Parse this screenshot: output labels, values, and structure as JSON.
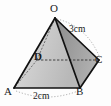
{
  "figure": {
    "type": "square-pyramid-diagram",
    "background_color": "#fdfdfd",
    "edge_color": "#1a1a1a",
    "hidden_edge_style": "dashed",
    "face_colors": {
      "left_face_OAD": "#e9e9e9",
      "front_face_OAB": "#cfcfcf",
      "right_face_OBC": "#9a9a9a",
      "base_ABCD": "#c3c3c3"
    },
    "vertices": [
      {
        "name": "O",
        "label": "O",
        "role": "apex",
        "x": 55,
        "y": 18
      },
      {
        "name": "A",
        "label": "A",
        "role": "base-front-left",
        "x": 14,
        "y": 88
      },
      {
        "name": "B",
        "label": "B",
        "role": "base-front-right",
        "x": 80,
        "y": 88
      },
      {
        "name": "C",
        "label": "C",
        "role": "base-right",
        "x": 99,
        "y": 60
      },
      {
        "name": "D",
        "label": "D",
        "role": "base-hidden-back",
        "x": 37,
        "y": 60
      }
    ],
    "measurements": [
      {
        "name": "edge-OC",
        "label": "3cm",
        "value": 3,
        "unit": "cm",
        "edge": "OC"
      },
      {
        "name": "edge-AB",
        "label": "2cm",
        "value": 2,
        "unit": "cm",
        "edge": "AB"
      }
    ],
    "edges": [
      {
        "from": "O",
        "to": "A",
        "hidden": false
      },
      {
        "from": "O",
        "to": "B",
        "hidden": false
      },
      {
        "from": "O",
        "to": "C",
        "hidden": false
      },
      {
        "from": "O",
        "to": "D",
        "hidden": true
      },
      {
        "from": "A",
        "to": "B",
        "hidden": false
      },
      {
        "from": "B",
        "to": "C",
        "hidden": false
      },
      {
        "from": "C",
        "to": "D",
        "hidden": true
      },
      {
        "from": "D",
        "to": "A",
        "hidden": true
      }
    ]
  }
}
